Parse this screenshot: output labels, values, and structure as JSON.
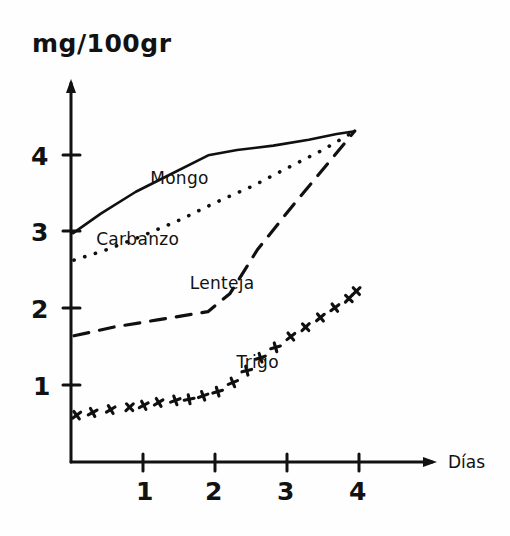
{
  "figure": {
    "yaxis_title": "mg/100gr",
    "xaxis_title": "Días"
  },
  "chart_data": {
    "type": "line",
    "title": "",
    "subtitle": "",
    "xlabel": "Días",
    "ylabel": "mg/100gr",
    "xlim": [
      0,
      4.6
    ],
    "ylim": [
      0,
      4.8
    ],
    "xticks": [
      "1",
      "2",
      "3",
      "4"
    ],
    "xtick_values": [
      1,
      2,
      3,
      4
    ],
    "yticks": [
      "1",
      "2",
      "3",
      "4"
    ],
    "ytick_values": [
      1,
      2,
      3,
      4
    ],
    "grid": false,
    "legend": "inline-labels",
    "annotations": [
      "Mongo",
      "Carbanzo",
      "Lenteja",
      "Trigo"
    ],
    "series": [
      {
        "name": "Mongo",
        "style": "solid",
        "label_position": {
          "x": 1.1,
          "y": 3.62
        },
        "x": [
          0.03,
          0.4,
          0.9,
          1.3,
          1.9,
          2.3,
          2.8,
          3.3,
          3.7,
          3.95
        ],
        "y": [
          2.98,
          3.25,
          3.52,
          3.72,
          4.0,
          4.07,
          4.13,
          4.2,
          4.26,
          4.3
        ]
      },
      {
        "name": "Carbanzo",
        "style": "dotted",
        "label_position": {
          "x": 0.35,
          "y": 2.82
        },
        "x": [
          0.03,
          0.5,
          1.0,
          1.5,
          2.0,
          2.5,
          3.0,
          3.5,
          3.95
        ],
        "y": [
          2.63,
          2.78,
          2.95,
          3.15,
          3.38,
          3.6,
          3.82,
          4.05,
          4.3
        ]
      },
      {
        "name": "Lenteja",
        "style": "dashed",
        "label_position": {
          "x": 1.65,
          "y": 2.25
        },
        "x": [
          0.03,
          0.6,
          1.2,
          1.9,
          2.2,
          2.6,
          3.1,
          3.6,
          3.95
        ],
        "y": [
          1.66,
          1.76,
          1.85,
          1.97,
          2.2,
          2.75,
          3.35,
          3.9,
          4.3
        ]
      },
      {
        "name": "Trigo",
        "style": "plus-markers",
        "label_position": {
          "x": 2.3,
          "y": 1.22
        },
        "x": [
          0.06,
          0.3,
          0.55,
          0.8,
          1.0,
          1.2,
          1.45,
          1.65,
          1.85,
          2.05,
          2.25,
          2.45,
          2.65,
          2.85,
          3.05,
          3.25,
          3.45,
          3.65,
          3.85,
          3.95
        ],
        "y": [
          0.6,
          0.64,
          0.67,
          0.7,
          0.73,
          0.76,
          0.79,
          0.83,
          0.87,
          0.93,
          1.05,
          1.2,
          1.36,
          1.5,
          1.62,
          1.75,
          1.88,
          2.0,
          2.12,
          2.22
        ]
      }
    ]
  }
}
